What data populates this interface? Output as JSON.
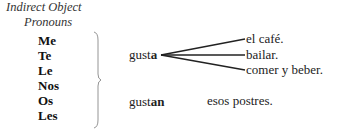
{
  "header": {
    "line1": "Indirect Object",
    "line2": "Pronouns"
  },
  "pronouns": [
    "Me",
    "Te",
    "Le",
    "Nos",
    "Os",
    "Les"
  ],
  "verbs": [
    {
      "stem": "gust",
      "ending": "a",
      "objects": [
        "el café.",
        "bailar.",
        "comer y beber."
      ]
    },
    {
      "stem": "gust",
      "ending": "an",
      "objects": [
        "esos postres."
      ]
    }
  ]
}
